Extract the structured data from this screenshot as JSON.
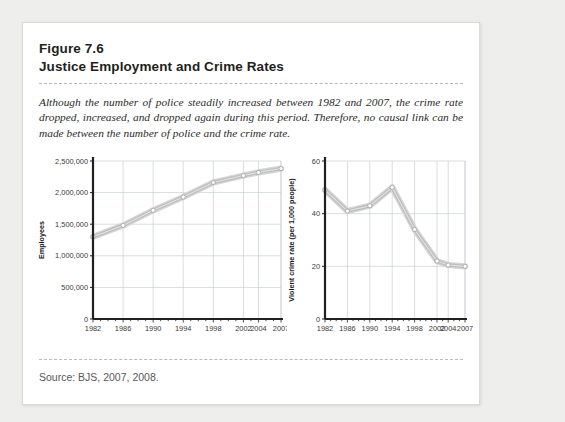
{
  "figure": {
    "number": "Figure 7.6",
    "title": "Justice Employment and Crime Rates",
    "caption": "Although the number of police steadily increased between 1982 and 2007, the crime rate dropped, increased, and dropped again during this period. Therefore, no causal link can be made between the number of police and the crime rate.",
    "source": "Source: BJS, 2007, 2008."
  },
  "colors": {
    "line": "#c9c9c9",
    "line_core": "#bdbdbd",
    "marker_fill": "#ffffff",
    "marker_stroke": "#9a9a9a",
    "grid": "#c9cfd6",
    "axis": "#231f20",
    "card_bg": "#ffffff",
    "page_bg": "#eeeeec"
  },
  "chart_data": [
    {
      "id": "justice-employment",
      "type": "line",
      "title": "",
      "xlabel": "",
      "ylabel": "Employees",
      "x": [
        1982,
        1986,
        1990,
        1994,
        1998,
        2002,
        2004,
        2007
      ],
      "xticklabels": [
        "1982",
        "1986",
        "1990",
        "1994",
        "1998",
        "2002",
        "2004",
        "2007"
      ],
      "values": [
        1300000,
        1480000,
        1720000,
        1930000,
        2160000,
        2270000,
        2320000,
        2380000
      ],
      "yticks": [
        0,
        500000,
        1000000,
        1500000,
        2000000,
        2500000
      ],
      "yticklabels": [
        "0",
        "500,000",
        "1,000,000",
        "1,500,000",
        "2,000,000",
        "2,500,000"
      ],
      "xlim": [
        1982,
        2007
      ],
      "ylim": [
        0,
        2500000
      ],
      "grid": true,
      "legend": "none"
    },
    {
      "id": "violent-crime-rate",
      "type": "line",
      "title": "",
      "xlabel": "",
      "ylabel": "Violent crime rate (per 1,000 people)",
      "x": [
        1982,
        1986,
        1990,
        1994,
        1998,
        2002,
        2004,
        2007
      ],
      "xticklabels": [
        "1982",
        "1986",
        "1990",
        "1994",
        "1998",
        "2002",
        "2004",
        "2007"
      ],
      "values": [
        49,
        41,
        43,
        50,
        34,
        22,
        20.5,
        20
      ],
      "yticks": [
        0,
        20,
        40,
        60
      ],
      "yticklabels": [
        "0",
        "20",
        "40",
        "60"
      ],
      "xlim": [
        1982,
        2007
      ],
      "ylim": [
        0,
        60
      ],
      "grid": true,
      "legend": "none"
    }
  ]
}
